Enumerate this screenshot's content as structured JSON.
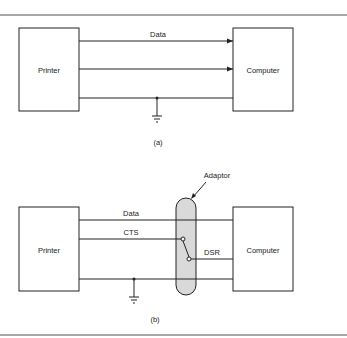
{
  "figure_a": {
    "left_box": "Printer",
    "right_box": "Computer",
    "line_label": "Data",
    "caption": "(a)"
  },
  "figure_b": {
    "left_box": "Printer",
    "right_box": "Computer",
    "adaptor_label": "Adaptor",
    "data_label": "Data",
    "cts_label": "CTS",
    "dsr_label": "DSR",
    "caption": "(b)"
  },
  "colors": {
    "line": "#222222",
    "rule": "#8a8a8a",
    "adaptor_fill": "#d9d9d9"
  }
}
